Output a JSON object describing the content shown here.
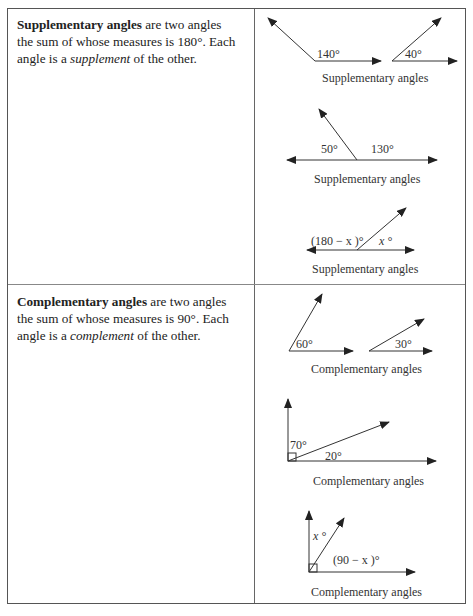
{
  "rows": [
    {
      "term": "Supplementary angles",
      "definition_pre": " are two angles the sum of whose measures is 180°. Each angle is a ",
      "emph": "supplement",
      "definition_post": " of the other.",
      "figures": [
        {
          "labels": [
            "140°",
            "40°"
          ],
          "caption": "Supplementary angles"
        },
        {
          "labels": [
            "50°",
            "130°"
          ],
          "caption": "Supplementary angles"
        },
        {
          "labels": [
            "(180 − x )°",
            "x °"
          ],
          "caption": "Supplementary angles"
        }
      ]
    },
    {
      "term": "Complementary angles",
      "definition_pre": " are two angles the sum of whose measures is 90°. Each angle is a ",
      "emph": "complement",
      "definition_post": " of the other.",
      "figures": [
        {
          "labels": [
            "60°",
            "30°"
          ],
          "caption": "Complementary angles"
        },
        {
          "labels": [
            "70°",
            "20°"
          ],
          "caption": "Complementary angles"
        },
        {
          "labels": [
            "x °",
            "(90 − x )°"
          ],
          "caption": "Complementary angles"
        }
      ]
    }
  ]
}
